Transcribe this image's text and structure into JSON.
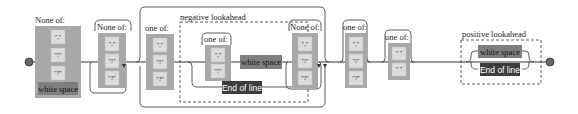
{
  "diagram": {
    "type": "regex-railroad",
    "colors": {
      "charset_group": "#a8a8a8",
      "literal_box": "#dcdcdc",
      "whitespace_box": "#7f7f7f",
      "end_of_line_box": "#3d3d3d",
      "rail": "#333333",
      "terminal": "#666666"
    },
    "nodes": [
      {
        "id": "n1",
        "kind": "charset",
        "label": "None of:",
        "items": [
          "\",\"",
          "\"!\"",
          "\"?\"",
          "white space"
        ]
      },
      {
        "id": "n2",
        "kind": "charset",
        "label": "None of:",
        "items": [
          "\",\"",
          "\"!\"",
          "\"?\""
        ],
        "repeat": "one-or-more"
      },
      {
        "id": "n3",
        "kind": "charset",
        "label": "one of:",
        "items": [
          "\",\"",
          "\"!\"",
          "\"?\""
        ]
      },
      {
        "id": "n4",
        "kind": "lookahead",
        "label": "negative lookahead",
        "branches": [
          {
            "charset": {
              "label": "one of:",
              "items": [
                "\",\"",
                "\"!\""
              ]
            },
            "then": "white space"
          },
          {
            "then": "End of line"
          }
        ]
      },
      {
        "id": "n5",
        "kind": "charset",
        "label": "None of:",
        "items": [
          "\",\"",
          "\"!\"",
          "\"?\""
        ],
        "repeat": "one-or-more"
      },
      {
        "id": "n6",
        "kind": "charset",
        "label": "one of:",
        "items": [
          "\",\"",
          "\"!\"",
          "\"?\""
        ],
        "repeat": "one-or-more"
      },
      {
        "id": "n7",
        "kind": "charset",
        "label": "one of:",
        "items": [
          "\" \"",
          "\" \""
        ],
        "repeat": "one-or-more"
      },
      {
        "id": "n8",
        "kind": "lookahead",
        "label": "positive lookahead",
        "branches": [
          "white space",
          "End of line"
        ]
      }
    ],
    "text": {
      "none_of": "None of:",
      "one_of": "one of:",
      "comma": "\",\"",
      "excl": "\"!\"",
      "quest": "\"?\"",
      "space": "\" \"",
      "white_space": "white space",
      "end_of_line": "End of line",
      "negative_lookahead": "negative lookahead",
      "positive_lookahead": "positive lookahead"
    }
  }
}
